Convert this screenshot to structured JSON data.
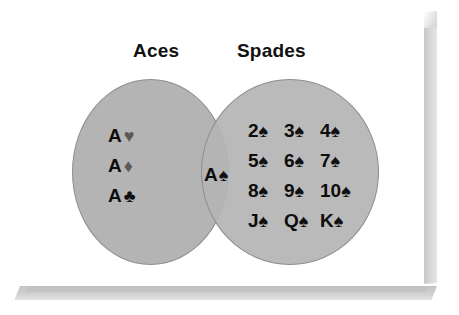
{
  "figure": {
    "type": "venn-diagram",
    "title_left": "Aces",
    "title_right": "Spades",
    "fill_color": "#b4b4b4",
    "outline_color": "#8e8e8e",
    "red_suit_render_color": "#5a5a5a",
    "black_suit_render_color": "#101010"
  },
  "sets": {
    "left_only": {
      "label": "Aces",
      "items": [
        {
          "rank": "A",
          "suit": "♥",
          "suit_name": "heart-suit-icon",
          "color_class": "red"
        },
        {
          "rank": "A",
          "suit": "♦",
          "suit_name": "diamond-suit-icon",
          "color_class": "red"
        },
        {
          "rank": "A",
          "suit": "♣",
          "suit_name": "club-suit-icon",
          "color_class": "black"
        }
      ]
    },
    "intersection": {
      "items": [
        {
          "rank": "A",
          "suit": "♠",
          "suit_name": "spade-suit-icon",
          "color_class": "black"
        }
      ]
    },
    "right_only": {
      "label": "Spades",
      "rows": [
        [
          {
            "rank": "2",
            "suit": "♠",
            "suit_name": "spade-suit-icon"
          },
          {
            "rank": "3",
            "suit": "♠",
            "suit_name": "spade-suit-icon"
          },
          {
            "rank": "4",
            "suit": "♠",
            "suit_name": "spade-suit-icon"
          }
        ],
        [
          {
            "rank": "5",
            "suit": "♠",
            "suit_name": "spade-suit-icon"
          },
          {
            "rank": "6",
            "suit": "♠",
            "suit_name": "spade-suit-icon"
          },
          {
            "rank": "7",
            "suit": "♠",
            "suit_name": "spade-suit-icon"
          }
        ],
        [
          {
            "rank": "8",
            "suit": "♠",
            "suit_name": "spade-suit-icon"
          },
          {
            "rank": "9",
            "suit": "♠",
            "suit_name": "spade-suit-icon"
          },
          {
            "rank": "10",
            "suit": "♠",
            "suit_name": "spade-suit-icon"
          }
        ],
        [
          {
            "rank": "J",
            "suit": "♠",
            "suit_name": "spade-suit-icon"
          },
          {
            "rank": "Q",
            "suit": "♠",
            "suit_name": "spade-suit-icon"
          },
          {
            "rank": "K",
            "suit": "♠",
            "suit_name": "spade-suit-icon"
          }
        ]
      ]
    }
  }
}
